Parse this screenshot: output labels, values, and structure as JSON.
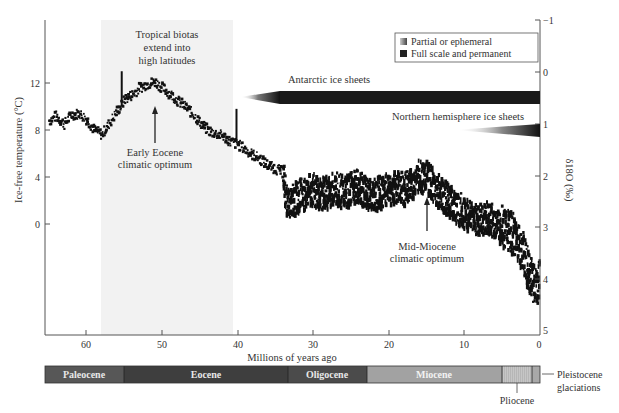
{
  "chart_data": {
    "type": "scatter",
    "title": "",
    "xlabel": "Millions of years ago",
    "ylabel_left": "Ice-free temperature (°C)",
    "ylabel_right": "δ18O (‰)",
    "x_ticks": [
      60,
      50,
      40,
      30,
      20,
      10,
      0
    ],
    "y_left_ticks": [
      12,
      8,
      4,
      0
    ],
    "y_right_ticks": [
      -1,
      0,
      1,
      2,
      3,
      4,
      5
    ],
    "xlim": [
      66,
      0
    ],
    "ylim_right": [
      5,
      -1
    ],
    "grid": false,
    "legend_position": "top-right",
    "series": [
      {
        "name": "Deep-sea benthic δ18O / ice-free temperature",
        "x_ma": [
          65,
          64,
          63,
          62,
          61,
          60,
          59,
          58,
          57,
          56,
          55.5,
          55,
          54,
          53,
          52,
          51,
          50,
          49,
          48,
          47,
          46,
          45,
          44,
          43,
          42,
          41,
          40,
          39,
          38,
          37,
          36,
          35,
          34,
          33.5,
          33,
          32,
          31,
          30,
          29,
          28,
          27,
          26,
          25,
          24,
          23,
          22,
          21,
          20,
          19,
          18,
          17,
          16,
          15,
          14,
          13,
          12,
          11,
          10,
          9,
          8,
          7,
          6,
          5,
          4,
          3,
          2.5,
          2,
          1.5,
          1,
          0.5,
          0
        ],
        "temp_c": [
          8.8,
          9.2,
          8.5,
          9.3,
          9.4,
          8.9,
          8.0,
          7.6,
          8.6,
          9.6,
          10.0,
          10.6,
          11.0,
          11.6,
          11.9,
          12.1,
          11.6,
          11.1,
          10.5,
          10.0,
          9.4,
          8.6,
          8.0,
          7.7,
          7.5,
          7.0,
          6.8,
          6.3,
          5.9,
          5.5,
          5.0,
          4.7,
          4.4,
          1.8,
          2.0,
          2.4,
          2.7,
          3.0,
          2.6,
          2.8,
          3.2,
          2.7,
          3.1,
          3.3,
          2.6,
          2.5,
          2.9,
          3.1,
          3.2,
          3.0,
          3.4,
          4.2,
          4.0,
          3.3,
          2.6,
          2.0,
          1.5,
          1.0,
          0.8,
          0.4,
          0.7,
          0.2,
          -0.2,
          -0.5,
          -1.2,
          -2.0,
          -2.8,
          -3.8,
          -4.8,
          -5.5,
          -4.5
        ]
      }
    ],
    "annotations": [
      {
        "text": "Tropical biotas extend into high latitudes",
        "x_range_ma": [
          58,
          40.5
        ]
      },
      {
        "text": "Early Eocene climatic optimum",
        "x_ma": 52
      },
      {
        "text": "Mid-Miocene climatic optimum",
        "x_ma": 15
      },
      {
        "text": "Antarctic ice sheets",
        "partial_from_ma": 40,
        "full_from_ma": 34,
        "to_ma": 0
      },
      {
        "text": "Northern hemisphere ice sheets",
        "partial_from_ma": 13,
        "full_from_ma": 3,
        "to_ma": 0
      }
    ],
    "epochs": [
      {
        "name": "Paleocene",
        "start_ma": 65.5,
        "end_ma": 55.8
      },
      {
        "name": "Eocene",
        "start_ma": 55.8,
        "end_ma": 33.9
      },
      {
        "name": "Oligocene",
        "start_ma": 33.9,
        "end_ma": 23
      },
      {
        "name": "Miocene",
        "start_ma": 23,
        "end_ma": 5.3
      },
      {
        "name": "Pliocene",
        "start_ma": 5.3,
        "end_ma": 1.8
      },
      {
        "name": "Pleistocene glaciations",
        "start_ma": 1.8,
        "end_ma": 0
      }
    ]
  },
  "labels": {
    "xlabel": "Millions of years ago",
    "ylabel_left": "Ice-free temperature (°C)",
    "ylabel_right": "δ18O (‰)",
    "tropical_1": "Tropical biotas",
    "tropical_2": "extend into",
    "tropical_3": "high latitudes",
    "eeco_1": "Early Eocene",
    "eeco_2": "climatic optimum",
    "mmco_1": "Mid-Miocene",
    "mmco_2": "climatic optimum",
    "antarctic": "Antarctic ice sheets",
    "northern": "Northern hemisphere ice sheets",
    "legend_partial": "Partial or ephemeral",
    "legend_full": "Full scale and permanent",
    "pliocene": "Pliocene",
    "pleistocene_1": "Pleistocene",
    "pleistocene_2": "glaciations"
  },
  "ticks": {
    "x": [
      "60",
      "50",
      "40",
      "30",
      "20",
      "10",
      "0"
    ],
    "left": [
      "12",
      "8",
      "4",
      "0"
    ],
    "right": [
      "−1",
      "0",
      "1",
      "2",
      "3",
      "4",
      "5"
    ]
  },
  "epoch_labels": [
    "Paleocene",
    "Eocene",
    "Oligocene",
    "Miocene"
  ],
  "colors": {
    "data": "#111111",
    "shade": "#f1f1f1",
    "paleocene": "#565656",
    "eocene": "#3c3c3c",
    "oligocene": "#4a4a4a",
    "miocene": "#9e9e9e",
    "pliocene": "#c4c4c4",
    "pleistocene": "#a8a8a8"
  }
}
